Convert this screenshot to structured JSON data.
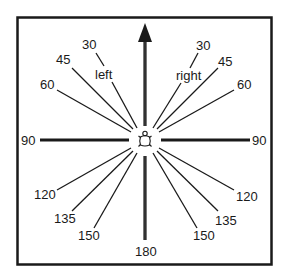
{
  "diagram": {
    "center_icon": "turtle-icon",
    "forward_arrow": "arrow-up-icon",
    "side_labels": {
      "left": "left",
      "right": "right"
    },
    "angle_labels": {
      "left_30": "30",
      "left_45": "45",
      "left_60": "60",
      "left_90": "90",
      "left_120": "120",
      "left_135": "135",
      "left_150": "150",
      "right_30": "30",
      "right_45": "45",
      "right_60": "60",
      "right_90": "90",
      "right_120": "120",
      "right_135": "135",
      "right_150": "150",
      "bottom_180": "180"
    },
    "colors": {
      "line": "#1a1a1a",
      "border": "#1a1a1a",
      "background": "#ffffff"
    }
  }
}
